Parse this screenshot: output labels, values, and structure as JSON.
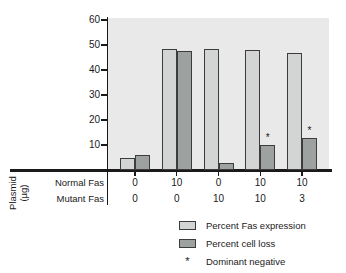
{
  "colors": {
    "canvas": "#ffffff",
    "plot_background": "#e8e9e8",
    "bar_light": "#d2d5d3",
    "bar_dark": "#9da19f",
    "bar_border": "#3c3c3c",
    "axis": "#1a1a1a",
    "text": "#1a1a1a"
  },
  "chart_data": {
    "type": "bar",
    "title": "",
    "ylabel": "",
    "ylim": [
      0,
      60
    ],
    "yticks": [
      10,
      20,
      30,
      40,
      50,
      60
    ],
    "grid": false,
    "legend_position": "bottom-right",
    "x_axis": {
      "title_line1": "Plasmid",
      "title_line2": "(µg)",
      "rows": [
        {
          "label": "Normal Fas",
          "values": [
            "0",
            "10",
            "0",
            "10",
            "10"
          ]
        },
        {
          "label": "Mutant Fas",
          "values": [
            "0",
            "0",
            "10",
            "10",
            "3"
          ]
        }
      ]
    },
    "series": [
      {
        "name": "Percent Fas expression",
        "color": "#d2d5d3",
        "values": [
          5,
          48.5,
          48.5,
          48,
          47
        ]
      },
      {
        "name": "Percent cell loss",
        "color": "#9da19f",
        "values": [
          6,
          47.5,
          3,
          10,
          13
        ]
      }
    ],
    "annotations": {
      "symbol": "*",
      "meaning": "Dominant negative",
      "series": "Percent cell loss",
      "dominant_negative": [
        false,
        false,
        false,
        true,
        true
      ]
    }
  },
  "legend": {
    "items": [
      {
        "swatch": "light-gray-box",
        "label": "Percent Fas expression"
      },
      {
        "swatch": "dark-gray-box",
        "label": "Percent cell loss"
      },
      {
        "swatch": "asterisk",
        "symbol": "*",
        "label": "Dominant negative"
      }
    ]
  }
}
